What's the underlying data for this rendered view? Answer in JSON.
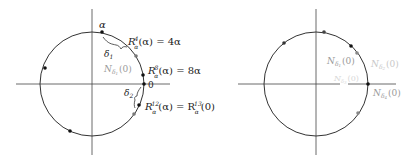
{
  "left_panel": {
    "circle": {
      "cx": 92,
      "cy": 84,
      "r": 52
    },
    "axes": {
      "h": [
        16,
        170
      ],
      "v": [
        9,
        155
      ]
    },
    "labels": {
      "alpha": "α",
      "r4": "R",
      "r4_sup": "4",
      "r4_sub": "α",
      "r4_rest": "(α) = 4α",
      "r8": "R",
      "r8_sup": "8",
      "r8_sub": "α",
      "r8_rest": "(α) = 8α",
      "zero": "0",
      "n_delta1": "N",
      "n_delta1_sub": "δ",
      "n_delta1_subsub": "1",
      "n_delta1_rest": "(0)",
      "delta1": "δ",
      "delta1_sub": "1",
      "delta2": "δ",
      "delta2_sub": "2",
      "r12": "R",
      "r12_sup": "12",
      "r12_sub": "α",
      "r12_mid": "(α) = R",
      "r13_sup": "13",
      "r13_sub": "α",
      "r12_rest": "(0)"
    },
    "points": [
      {
        "x": 102,
        "y": 32,
        "color": "#111"
      },
      {
        "x": 136,
        "y": 56,
        "color": "#777"
      },
      {
        "x": 143,
        "y": 75,
        "color": "#111"
      },
      {
        "x": 144,
        "y": 84,
        "color": "#111"
      },
      {
        "x": 139,
        "y": 105,
        "color": "#111"
      },
      {
        "x": 134,
        "y": 114,
        "color": "#777"
      },
      {
        "x": 45,
        "y": 68,
        "color": "#111"
      },
      {
        "x": 70,
        "y": 131,
        "color": "#111"
      }
    ]
  },
  "right_panel": {
    "circle": {
      "cx": 316,
      "cy": 84,
      "r": 52
    },
    "axes": {
      "h1": [
        238,
        340
      ],
      "h2": [
        348,
        396
      ],
      "v": [
        9,
        155
      ]
    },
    "labels": {
      "n_a": "N",
      "n_a_sub": "δ",
      "n_a_subsub": "1",
      "n_a_rest": "(0)",
      "n_b": "N",
      "n_b_sub": "δ",
      "n_b_subsub": "2",
      "n_b_rest": "(0)",
      "n_c": "N",
      "n_c_sub": "δ",
      "n_c_subsub": "3",
      "n_c_rest": "(0)",
      "n_d": "N",
      "n_d_sub": "δ",
      "n_d_subsub": "4",
      "n_d_rest": "(0)"
    },
    "points": [
      {
        "x": 324,
        "y": 32,
        "color": "#444"
      },
      {
        "x": 351,
        "y": 46,
        "color": "#111"
      },
      {
        "x": 357,
        "y": 53,
        "color": "#888"
      },
      {
        "x": 368,
        "y": 84,
        "color": "#111"
      },
      {
        "x": 358,
        "y": 113,
        "color": "#888"
      },
      {
        "x": 284,
        "y": 43,
        "color": "#333"
      }
    ]
  }
}
